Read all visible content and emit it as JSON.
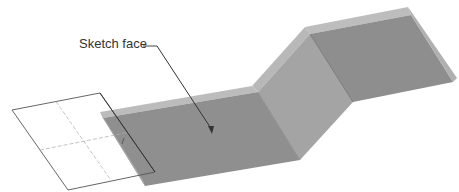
{
  "figure": {
    "callout_label": "Sketch face",
    "colors": {
      "face_dark": "#8f8f8f",
      "face_mid": "#9c9c9c",
      "bend_face": "#a6a6a6",
      "edge_light": "#bdbdbd",
      "outline": "#555555",
      "sketch_line": "#666666"
    }
  }
}
